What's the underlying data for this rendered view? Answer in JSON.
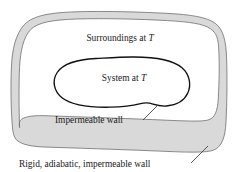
{
  "figure": {
    "type": "schematic",
    "colors": {
      "background": "#ffffff",
      "wall_fill": "#d9d9d9",
      "wall_stroke": "#6f6f6f",
      "system_stroke": "#111111",
      "text": "#1a1a1a",
      "leader": "#3a3a3a"
    }
  },
  "labels": {
    "surroundings": {
      "text": "Surroundings at ",
      "symbol": "T",
      "x": 120,
      "y": 41
    },
    "system": {
      "text": "System at ",
      "symbol": "T",
      "x": 124,
      "y": 81
    },
    "inner_wall": {
      "text": "Impermeable wall",
      "x": 55,
      "y": 123
    },
    "outer_wall": {
      "text": "Rigid, adiabatic, impermeable wall",
      "x": 19,
      "y": 167
    }
  },
  "leaders": [
    {
      "name": "inner-wall-leader",
      "from": [
        143,
        120
      ],
      "to": [
        158,
        105
      ]
    },
    {
      "name": "outer-wall-leader",
      "from": [
        191,
        163
      ],
      "to": [
        207,
        147
      ]
    }
  ]
}
